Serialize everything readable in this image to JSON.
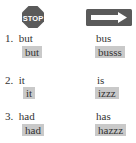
{
  "icons": {
    "left": {
      "name": "stop-sign-icon",
      "label": "STOP",
      "color": "#5a5a5a"
    },
    "right": {
      "name": "arrow-sign-icon",
      "color": "#5a5a5a"
    }
  },
  "items": [
    {
      "num": "1.",
      "left_word": "but",
      "left_box": "but",
      "right_word": "bus",
      "right_box": "busss"
    },
    {
      "num": "2.",
      "left_word": "it",
      "left_box": "it",
      "right_word": "is",
      "right_box": "izzz"
    },
    {
      "num": "3.",
      "left_word": "had",
      "left_box": "had",
      "right_word": "has",
      "right_box": "hazzz"
    }
  ]
}
